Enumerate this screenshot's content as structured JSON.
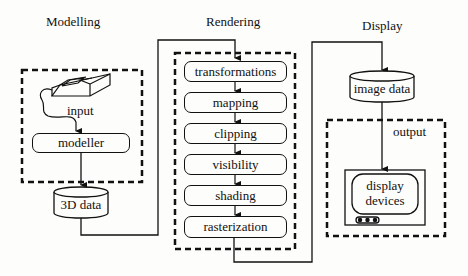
{
  "stages": {
    "modelling": "Modelling",
    "rendering": "Rendering",
    "display": "Display"
  },
  "modelling": {
    "input_label": "input",
    "modeller_label": "modeller",
    "data_store": "3D data",
    "input_device_icon": "scanner-tablet-icon"
  },
  "rendering": {
    "steps": [
      "transformations",
      "mapping",
      "clipping",
      "visibility",
      "shading",
      "rasterization"
    ]
  },
  "display": {
    "data_store": "image data",
    "output_label": "output",
    "device_line1": "display",
    "device_line2": "devices",
    "device_icon": "monitor-icon"
  },
  "colors": {
    "ink": "#111111",
    "background": "#fdfdfb"
  }
}
